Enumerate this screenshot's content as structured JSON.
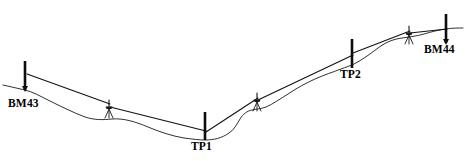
{
  "diagram": {
    "type": "differential-leveling-profile",
    "width": 467,
    "height": 161,
    "background_color": "#ffffff",
    "line_color": "#111111",
    "label_color": "#000000"
  },
  "labels": [
    {
      "id": "bm43",
      "text": "BM43",
      "x": 8,
      "y": 98,
      "name": "label-bm43"
    },
    {
      "id": "tp1",
      "text": "TP1",
      "x": 191,
      "y": 141,
      "name": "label-tp1"
    },
    {
      "id": "tp2",
      "text": "TP2",
      "x": 340,
      "y": 69,
      "name": "label-tp2"
    },
    {
      "id": "bm44",
      "text": "BM44",
      "x": 424,
      "y": 44,
      "name": "label-bm44"
    }
  ],
  "staffs": [
    {
      "id": "bm43",
      "label": "BM43",
      "x": 25,
      "top_y": 61,
      "base_y": 90,
      "name": "staff-rod-bm43"
    },
    {
      "id": "tp1",
      "label": "TP1",
      "x": 205,
      "top_y": 112,
      "base_y": 140,
      "name": "staff-rod-tp1"
    },
    {
      "id": "tp2",
      "label": "TP2",
      "x": 352,
      "top_y": 39,
      "base_y": 68,
      "name": "staff-rod-tp2"
    },
    {
      "id": "bm44",
      "label": "BM44",
      "x": 446,
      "top_y": 14,
      "base_y": 43,
      "name": "staff-rod-bm44"
    }
  ],
  "instruments": [
    {
      "id": "setup1",
      "x": 109,
      "ground_y": 117,
      "scope_y": 106,
      "backsight_to": "BM43",
      "foresight_to": "TP1",
      "name": "level-instrument-setup-1"
    },
    {
      "id": "setup2",
      "x": 257,
      "ground_y": 110,
      "scope_y": 99,
      "backsight_to": "TP1",
      "foresight_to": "TP2",
      "name": "level-instrument-setup-2"
    },
    {
      "id": "setup3",
      "x": 409,
      "ground_y": 43,
      "scope_y": 32,
      "backsight_to": "TP2",
      "foresight_to": "BM44",
      "name": "level-instrument-setup-3"
    }
  ],
  "sight_lines": [
    {
      "id": "bs1",
      "from": "BM43",
      "to": "setup1",
      "path": "M 27 74 L 110 104",
      "name": "backsight-line-bm43"
    },
    {
      "id": "fs1",
      "from": "setup1",
      "to": "TP1",
      "path": "M 110 107 L 206 131",
      "name": "foresight-line-tp1"
    },
    {
      "id": "bs2",
      "from": "TP1",
      "to": "setup2",
      "path": "M 206 132 L 258 98",
      "name": "backsight-line-tp1"
    },
    {
      "id": "fs2",
      "from": "setup2",
      "to": "TP2",
      "path": "M 258 100 L 353 55",
      "name": "foresight-line-tp2"
    },
    {
      "id": "bs3",
      "from": "TP2",
      "to": "setup3",
      "path": "M 353 53 L 410 31",
      "name": "backsight-line-tp2"
    },
    {
      "id": "fs3",
      "from": "setup3",
      "to": "BM44",
      "path": "M 410 33 L 447 29",
      "name": "foresight-line-bm44"
    }
  ],
  "ground_profile": {
    "name": "ground-surface-line",
    "path": "M 3 85 C 10 87 18 88 25 90 C 33 92 40 96 48 100 C 60 106 72 112 85 117 C 94 120 103 120 112 119 C 124 118 136 122 148 127 C 160 132 172 136 184 138 C 192 139 199 140 205 140 C 214 140 222 138 229 133 C 234 130 237 124 240 119 C 243 114 247 111 252 110 C 256 109 261 109 266 107 C 273 104 280 99 288 94 C 297 88 306 83 315 79 C 324 75 333 72 341 69 C 346 67 350 66 354 64 C 362 60 370 54 378 48 C 386 42 394 39 402 38 C 409 37 417 36 424 34 C 431 32 438 30 446 29 C 452 28 458 28 463 28",
    "description": "undulating natural ground surface from BM43 through TP1 and TP2 to BM44"
  }
}
